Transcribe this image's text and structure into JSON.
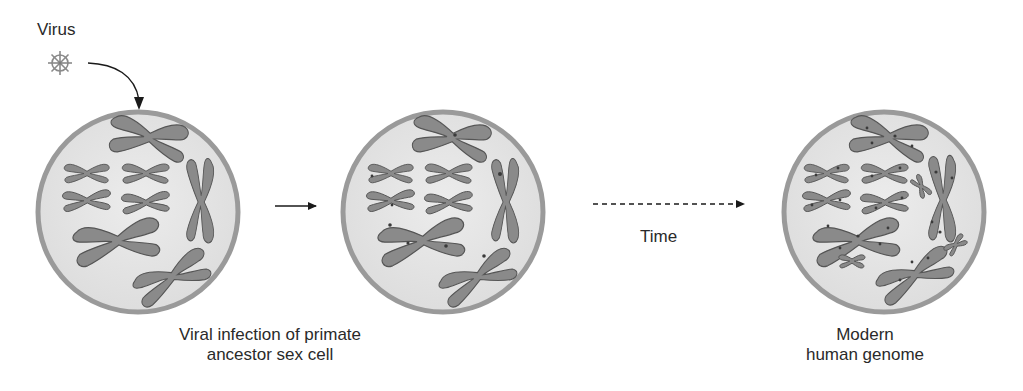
{
  "diagram": {
    "labels": {
      "virus": "Virus",
      "time": "Time",
      "caption_left_line1": "Viral infection of primate",
      "caption_left_line2": "ancestor sex cell",
      "caption_right_line1": "Modern",
      "caption_right_line2": "human genome"
    },
    "icons": {
      "virus": "virus-icon",
      "curved_arrow": "curved-arrow-icon",
      "solid_arrow": "arrow-right-icon",
      "dashed_arrow": "dashed-arrow-right-icon"
    },
    "stages": [
      {
        "name": "ancestor-cell",
        "state": "uninfected nucleus with chromosomes"
      },
      {
        "name": "infected-cell",
        "state": "viral DNA inserted into chromosomes (marks)"
      },
      {
        "name": "modern-cell",
        "state": "many viral insertions across chromosomes, extra small chromosomes"
      }
    ],
    "colors": {
      "cell_border": "#9a9a9a",
      "cell_fill": "#e6e6e6",
      "chromosome_fill": "#8a8a8a",
      "chromosome_stroke": "#555555",
      "mark": "#3a3a3a",
      "text": "#2a2a2a",
      "arrow": "#1a1a1a"
    }
  }
}
